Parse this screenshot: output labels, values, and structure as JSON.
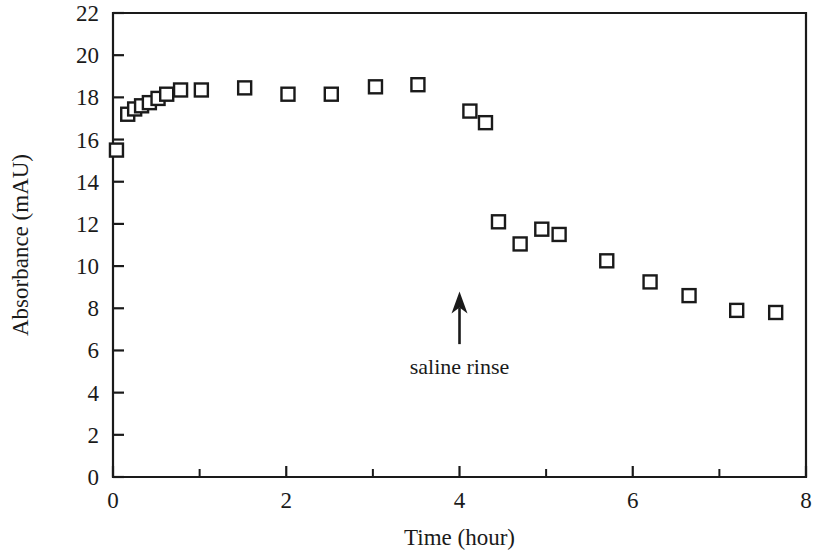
{
  "chart_data": {
    "type": "scatter",
    "title": "",
    "xlabel": "Time (hour)",
    "ylabel": "Absorbance (mAU)",
    "xlim": [
      0,
      8
    ],
    "ylim": [
      0,
      22
    ],
    "grid": false,
    "legend": null,
    "x_ticks": [
      0,
      2,
      4,
      6,
      8
    ],
    "x_tick_labels": [
      "0",
      "2",
      "4",
      "6",
      "8"
    ],
    "x_minor_ticks": [
      1,
      3,
      5,
      7
    ],
    "y_ticks": [
      0,
      2,
      4,
      6,
      8,
      10,
      12,
      14,
      16,
      18,
      20,
      22
    ],
    "y_tick_labels": [
      "0",
      "2",
      "4",
      "6",
      "8",
      "10",
      "12",
      "14",
      "16",
      "18",
      "20",
      "22"
    ],
    "marker": "open-square",
    "marker_color": "#1a1a1a",
    "series": [
      {
        "name": "Absorbance",
        "points": [
          {
            "x": 0.04,
            "y": 15.5
          },
          {
            "x": 0.17,
            "y": 17.2
          },
          {
            "x": 0.25,
            "y": 17.45
          },
          {
            "x": 0.33,
            "y": 17.6
          },
          {
            "x": 0.42,
            "y": 17.75
          },
          {
            "x": 0.52,
            "y": 17.95
          },
          {
            "x": 0.62,
            "y": 18.15
          },
          {
            "x": 0.78,
            "y": 18.35
          },
          {
            "x": 1.02,
            "y": 18.35
          },
          {
            "x": 1.52,
            "y": 18.45
          },
          {
            "x": 2.02,
            "y": 18.15
          },
          {
            "x": 2.52,
            "y": 18.15
          },
          {
            "x": 3.03,
            "y": 18.5
          },
          {
            "x": 3.52,
            "y": 18.6
          },
          {
            "x": 4.12,
            "y": 17.35
          },
          {
            "x": 4.3,
            "y": 16.8
          },
          {
            "x": 4.45,
            "y": 12.1
          },
          {
            "x": 4.7,
            "y": 11.05
          },
          {
            "x": 4.95,
            "y": 11.75
          },
          {
            "x": 5.15,
            "y": 11.5
          },
          {
            "x": 5.7,
            "y": 10.25
          },
          {
            "x": 6.2,
            "y": 9.25
          },
          {
            "x": 6.65,
            "y": 8.6
          },
          {
            "x": 7.2,
            "y": 7.9
          },
          {
            "x": 7.65,
            "y": 7.8
          }
        ]
      }
    ],
    "annotations": [
      {
        "label": "saline rinse",
        "arrow_x": 4.0,
        "arrow_y_tail": 6.3,
        "arrow_y_tip": 8.8,
        "label_x": 4.0,
        "label_y": 4.9
      }
    ]
  }
}
